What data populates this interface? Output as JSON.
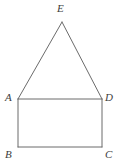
{
  "figure": {
    "type": "geometry-diagram",
    "background_color": "#ffffff",
    "stroke_color": "#6b6b6b",
    "label_color": "#3d3d3d",
    "stroke_width": 1,
    "canvas": {
      "width": 120,
      "height": 167
    },
    "vertices": [
      {
        "id": "E",
        "label": "E",
        "x": 62,
        "y": 22,
        "label_x": 57,
        "label_y": 3
      },
      {
        "id": "A",
        "label": "A",
        "x": 18,
        "y": 99,
        "label_x": 5,
        "label_y": 92
      },
      {
        "id": "D",
        "label": "D",
        "x": 102,
        "y": 99,
        "label_x": 105,
        "label_y": 92
      },
      {
        "id": "B",
        "label": "B",
        "x": 18,
        "y": 147,
        "label_x": 5,
        "label_y": 149
      },
      {
        "id": "C",
        "label": "C",
        "x": 102,
        "y": 147,
        "label_x": 105,
        "label_y": 149
      }
    ],
    "segments": [
      {
        "id": "AE",
        "name": "triangle-left-leg",
        "x1": 18,
        "y1": 99,
        "x2": 62,
        "y2": 22
      },
      {
        "id": "ED",
        "name": "triangle-right-leg",
        "x1": 62,
        "y1": 22,
        "x2": 102,
        "y2": 99
      },
      {
        "id": "AD",
        "name": "rectangle-top-side",
        "x1": 18,
        "y1": 99,
        "x2": 102,
        "y2": 99
      },
      {
        "id": "AB",
        "name": "rectangle-left-side",
        "x1": 18,
        "y1": 99,
        "x2": 18,
        "y2": 147
      },
      {
        "id": "DC",
        "name": "rectangle-right-side",
        "x1": 102,
        "y1": 99,
        "x2": 102,
        "y2": 147
      },
      {
        "id": "BC",
        "name": "rectangle-bottom-side",
        "x1": 18,
        "y1": 147,
        "x2": 102,
        "y2": 147
      }
    ]
  }
}
